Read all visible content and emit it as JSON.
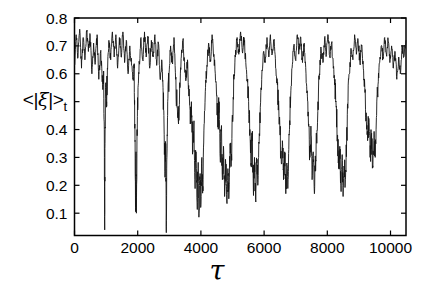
{
  "chart_data": {
    "type": "line",
    "title": "",
    "xlabel": "τ",
    "ylabel": "<|ξ|>t",
    "ylabel_parts": {
      "prefix": "<|",
      "symbol": "ξ",
      "suffix": "|>",
      "sub": "t"
    },
    "xlim": [
      0,
      10490
    ],
    "ylim": [
      0.02,
      0.8
    ],
    "xticks": [
      0,
      2000,
      4000,
      6000,
      8000,
      10000
    ],
    "xtick_labels": [
      "0",
      "2000",
      "4000",
      "6000",
      "8000",
      "10000"
    ],
    "yticks": [
      0.1,
      0.2,
      0.3,
      0.4,
      0.5,
      0.6,
      0.7,
      0.8
    ],
    "ytick_labels": [
      "0.1",
      "0.2",
      "0.3",
      "0.4",
      "",
      "0.6",
      "0.7",
      "0.8"
    ],
    "grid": false,
    "box": true,
    "legend": null,
    "background": "#ffffff",
    "axis_color": "#000000",
    "line_color": "#141414",
    "noise": {
      "seed": 20211,
      "band_amplitude": 0.021,
      "dip_amplitude": 0.05,
      "dip_threshold": 0.52,
      "subdivisions": 6
    },
    "series": [
      {
        "name": "time-averaged order parameter <|xi|>_t",
        "points": [
          [
            0,
            0.63
          ],
          [
            55,
            0.74
          ],
          [
            110,
            0.66
          ],
          [
            165,
            0.76
          ],
          [
            220,
            0.62
          ],
          [
            275,
            0.73
          ],
          [
            330,
            0.65
          ],
          [
            385,
            0.75
          ],
          [
            440,
            0.68
          ],
          [
            495,
            0.74
          ],
          [
            550,
            0.6
          ],
          [
            605,
            0.71
          ],
          [
            660,
            0.64
          ],
          [
            715,
            0.74
          ],
          [
            770,
            0.58
          ],
          [
            825,
            0.68
          ],
          [
            870,
            0.6
          ],
          [
            900,
            0.55
          ],
          [
            925,
            0.6
          ],
          [
            945,
            0.3
          ],
          [
            955,
            0.04
          ],
          [
            965,
            0.35
          ],
          [
            985,
            0.55
          ],
          [
            1010,
            0.48
          ],
          [
            1040,
            0.62
          ],
          [
            1090,
            0.72
          ],
          [
            1145,
            0.65
          ],
          [
            1200,
            0.75
          ],
          [
            1255,
            0.66
          ],
          [
            1310,
            0.74
          ],
          [
            1365,
            0.62
          ],
          [
            1420,
            0.73
          ],
          [
            1475,
            0.66
          ],
          [
            1530,
            0.75
          ],
          [
            1585,
            0.64
          ],
          [
            1640,
            0.72
          ],
          [
            1695,
            0.6
          ],
          [
            1750,
            0.7
          ],
          [
            1805,
            0.63
          ],
          [
            1850,
            0.58
          ],
          [
            1885,
            0.62
          ],
          [
            1910,
            0.42
          ],
          [
            1930,
            0.12
          ],
          [
            1945,
            0.32
          ],
          [
            1960,
            0.1
          ],
          [
            1980,
            0.4
          ],
          [
            2010,
            0.55
          ],
          [
            2050,
            0.64
          ],
          [
            2105,
            0.73
          ],
          [
            2160,
            0.65
          ],
          [
            2215,
            0.75
          ],
          [
            2270,
            0.66
          ],
          [
            2325,
            0.73
          ],
          [
            2380,
            0.62
          ],
          [
            2435,
            0.72
          ],
          [
            2490,
            0.66
          ],
          [
            2545,
            0.74
          ],
          [
            2600,
            0.63
          ],
          [
            2655,
            0.71
          ],
          [
            2710,
            0.58
          ],
          [
            2760,
            0.65
          ],
          [
            2800,
            0.55
          ],
          [
            2830,
            0.45
          ],
          [
            2860,
            0.25
          ],
          [
            2885,
            0.35
          ],
          [
            2905,
            0.03
          ],
          [
            2925,
            0.3
          ],
          [
            2950,
            0.5
          ],
          [
            2990,
            0.6
          ],
          [
            3040,
            0.7
          ],
          [
            3095,
            0.64
          ],
          [
            3150,
            0.73
          ],
          [
            3200,
            0.58
          ],
          [
            3245,
            0.48
          ],
          [
            3290,
            0.42
          ],
          [
            3335,
            0.55
          ],
          [
            3380,
            0.66
          ],
          [
            3430,
            0.72
          ],
          [
            3480,
            0.64
          ],
          [
            3530,
            0.58
          ],
          [
            3575,
            0.65
          ],
          [
            3620,
            0.52
          ],
          [
            3665,
            0.42
          ],
          [
            3700,
            0.5
          ],
          [
            3740,
            0.32
          ],
          [
            3775,
            0.42
          ],
          [
            3810,
            0.22
          ],
          [
            3845,
            0.32
          ],
          [
            3880,
            0.14
          ],
          [
            3910,
            0.26
          ],
          [
            3940,
            0.1
          ],
          [
            3970,
            0.22
          ],
          [
            4000,
            0.13
          ],
          [
            4030,
            0.3
          ],
          [
            4065,
            0.18
          ],
          [
            4100,
            0.42
          ],
          [
            4145,
            0.55
          ],
          [
            4190,
            0.63
          ],
          [
            4245,
            0.71
          ],
          [
            4300,
            0.65
          ],
          [
            4355,
            0.74
          ],
          [
            4410,
            0.67
          ],
          [
            4455,
            0.6
          ],
          [
            4500,
            0.52
          ],
          [
            4540,
            0.42
          ],
          [
            4575,
            0.5
          ],
          [
            4610,
            0.3
          ],
          [
            4645,
            0.4
          ],
          [
            4680,
            0.22
          ],
          [
            4715,
            0.34
          ],
          [
            4750,
            0.16
          ],
          [
            4785,
            0.28
          ],
          [
            4820,
            0.14
          ],
          [
            4855,
            0.26
          ],
          [
            4890,
            0.18
          ],
          [
            4925,
            0.35
          ],
          [
            4960,
            0.28
          ],
          [
            5000,
            0.45
          ],
          [
            5045,
            0.58
          ],
          [
            5090,
            0.66
          ],
          [
            5145,
            0.73
          ],
          [
            5200,
            0.67
          ],
          [
            5255,
            0.75
          ],
          [
            5310,
            0.68
          ],
          [
            5365,
            0.73
          ],
          [
            5420,
            0.64
          ],
          [
            5465,
            0.58
          ],
          [
            5510,
            0.5
          ],
          [
            5550,
            0.4
          ],
          [
            5590,
            0.28
          ],
          [
            5625,
            0.38
          ],
          [
            5660,
            0.18
          ],
          [
            5695,
            0.3
          ],
          [
            5730,
            0.15
          ],
          [
            5765,
            0.28
          ],
          [
            5800,
            0.2
          ],
          [
            5840,
            0.35
          ],
          [
            5880,
            0.48
          ],
          [
            5925,
            0.58
          ],
          [
            5980,
            0.68
          ],
          [
            6035,
            0.64
          ],
          [
            6090,
            0.73
          ],
          [
            6145,
            0.66
          ],
          [
            6200,
            0.74
          ],
          [
            6255,
            0.67
          ],
          [
            6310,
            0.72
          ],
          [
            6365,
            0.62
          ],
          [
            6420,
            0.56
          ],
          [
            6465,
            0.48
          ],
          [
            6505,
            0.38
          ],
          [
            6545,
            0.28
          ],
          [
            6580,
            0.36
          ],
          [
            6615,
            0.22
          ],
          [
            6650,
            0.32
          ],
          [
            6685,
            0.17
          ],
          [
            6720,
            0.28
          ],
          [
            6755,
            0.22
          ],
          [
            6795,
            0.38
          ],
          [
            6840,
            0.52
          ],
          [
            6885,
            0.62
          ],
          [
            6940,
            0.7
          ],
          [
            6995,
            0.65
          ],
          [
            7050,
            0.74
          ],
          [
            7105,
            0.68
          ],
          [
            7160,
            0.73
          ],
          [
            7215,
            0.64
          ],
          [
            7270,
            0.71
          ],
          [
            7325,
            0.6
          ],
          [
            7370,
            0.52
          ],
          [
            7410,
            0.42
          ],
          [
            7450,
            0.3
          ],
          [
            7485,
            0.38
          ],
          [
            7520,
            0.22
          ],
          [
            7555,
            0.32
          ],
          [
            7590,
            0.17
          ],
          [
            7625,
            0.28
          ],
          [
            7660,
            0.38
          ],
          [
            7705,
            0.5
          ],
          [
            7750,
            0.6
          ],
          [
            7805,
            0.69
          ],
          [
            7860,
            0.64
          ],
          [
            7915,
            0.73
          ],
          [
            7970,
            0.67
          ],
          [
            8025,
            0.74
          ],
          [
            8080,
            0.66
          ],
          [
            8135,
            0.71
          ],
          [
            8190,
            0.62
          ],
          [
            8235,
            0.56
          ],
          [
            8280,
            0.48
          ],
          [
            8320,
            0.38
          ],
          [
            8360,
            0.26
          ],
          [
            8395,
            0.34
          ],
          [
            8430,
            0.2
          ],
          [
            8465,
            0.3
          ],
          [
            8500,
            0.16
          ],
          [
            8535,
            0.26
          ],
          [
            8570,
            0.22
          ],
          [
            8610,
            0.36
          ],
          [
            8655,
            0.5
          ],
          [
            8700,
            0.6
          ],
          [
            8755,
            0.69
          ],
          [
            8810,
            0.65
          ],
          [
            8865,
            0.74
          ],
          [
            8920,
            0.67
          ],
          [
            8975,
            0.72
          ],
          [
            9030,
            0.64
          ],
          [
            9085,
            0.7
          ],
          [
            9140,
            0.62
          ],
          [
            9185,
            0.55
          ],
          [
            9230,
            0.46
          ],
          [
            9275,
            0.36
          ],
          [
            9315,
            0.44
          ],
          [
            9355,
            0.3
          ],
          [
            9395,
            0.38
          ],
          [
            9435,
            0.27
          ],
          [
            9475,
            0.36
          ],
          [
            9515,
            0.3
          ],
          [
            9560,
            0.45
          ],
          [
            9605,
            0.56
          ],
          [
            9650,
            0.64
          ],
          [
            9705,
            0.7
          ],
          [
            9760,
            0.66
          ],
          [
            9815,
            0.73
          ],
          [
            9870,
            0.67
          ],
          [
            9925,
            0.72
          ],
          [
            9980,
            0.64
          ],
          [
            10035,
            0.7
          ],
          [
            10090,
            0.62
          ],
          [
            10145,
            0.68
          ],
          [
            10200,
            0.58
          ],
          [
            10255,
            0.66
          ],
          [
            10310,
            0.6
          ],
          [
            10365,
            0.7
          ],
          [
            10420,
            0.66
          ],
          [
            10490,
            0.72
          ]
        ]
      }
    ]
  }
}
